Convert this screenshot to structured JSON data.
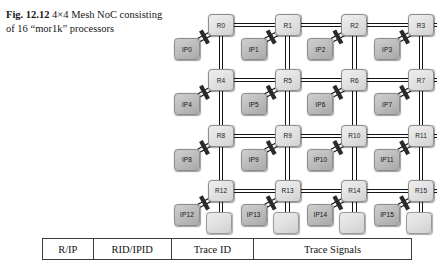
{
  "caption": {
    "label": "Fig. 12.12",
    "text": "4×4 Mesh NoC consisting of 16 “mor1k” processors"
  },
  "diagram": {
    "type": "mesh-network-on-chip",
    "rows": 4,
    "cols": 4,
    "routers": [
      "R0",
      "R1",
      "R2",
      "R3",
      "R4",
      "R5",
      "R6",
      "R7",
      "R8",
      "R9",
      "R10",
      "R11",
      "R12",
      "R13",
      "R14",
      "R15"
    ],
    "processors": [
      "IP0",
      "IP1",
      "IP2",
      "IP3",
      "IP4",
      "IP5",
      "IP6",
      "IP7",
      "IP8",
      "IP9",
      "IP10",
      "IP11",
      "IP12",
      "IP13",
      "IP14",
      "IP15"
    ],
    "link_style": "double-line-bus",
    "tap_marker": "diagonal-slash",
    "colors": {
      "router_fill": "#e3e3e3",
      "ip_fill": "#bdbdbd",
      "link": "#141414",
      "border": "#8d8d8d"
    }
  },
  "table": {
    "headers": [
      "R/IP",
      "RID/IPID",
      "Trace ID",
      "Trace Signals"
    ]
  }
}
